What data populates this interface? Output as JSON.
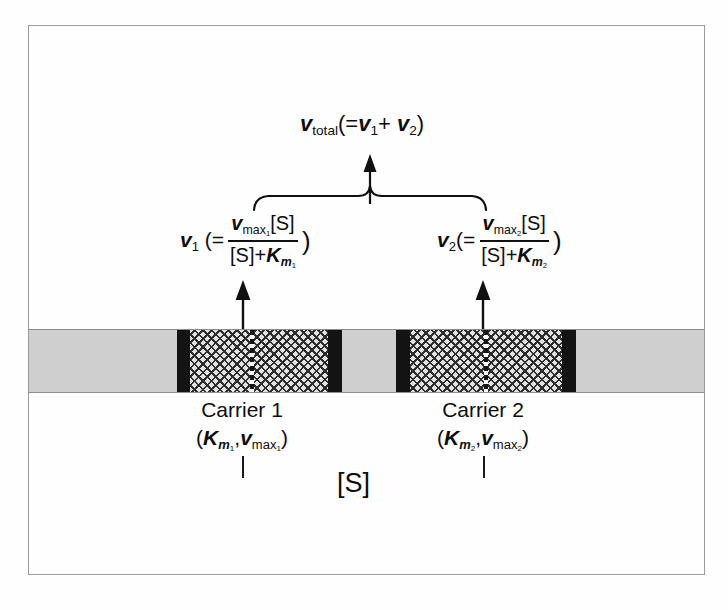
{
  "figure": {
    "kind": "membrane-transport-kinetics-diagram",
    "frame_color": "#9b9b9b",
    "ink_color": "#0d0d0d"
  },
  "equations": {
    "total": {
      "symbol": "v",
      "symbol_sub": "total",
      "expression": "(=v",
      "term1_sub": "1",
      "plus": "+ v",
      "term2_sub": "2",
      "close": ")",
      "plain": "v_total (= v1 + v2)"
    },
    "v1": {
      "lead_symbol": "v",
      "lead_sub": "1",
      "open": "(=",
      "numerator_symbol": "v",
      "numerator_sub": "max",
      "numerator_sub_index": "1",
      "numerator_tail": "[S]",
      "denominator_left": "[S]",
      "denominator_plus": "+",
      "denominator_symbol": "K",
      "denominator_sub": "m",
      "denominator_sub_index": "1",
      "close": ")",
      "plain": "v1 (= vmax1[S] / ([S] + Km1))"
    },
    "v2": {
      "lead_symbol": "v",
      "lead_sub": "2",
      "open": "(=",
      "numerator_symbol": "v",
      "numerator_sub": "max",
      "numerator_sub_index": "2",
      "numerator_tail": "[S]",
      "denominator_left": "[S]",
      "denominator_plus": "+",
      "denominator_symbol": "K",
      "denominator_sub": "m",
      "denominator_sub_index": "2",
      "close": ")",
      "plain": "v2 (= vmax2[S] / ([S] + Km2))"
    }
  },
  "carriers": [
    {
      "title": "Carrier 1",
      "param_open": "(",
      "param_k": "K",
      "param_k_sub": "m",
      "param_k_index": "1",
      "param_sep": ",",
      "param_v": "v",
      "param_v_sub": "max",
      "param_v_index": "1",
      "param_close": ")",
      "plain": "Carrier 1 (Km1, vmax1)"
    },
    {
      "title": "Carrier 2",
      "param_open": "(",
      "param_k": "K",
      "param_k_sub": "m",
      "param_k_index": "2",
      "param_sep": ",",
      "param_v": "v",
      "param_v_sub": "max",
      "param_v_index": "2",
      "param_close": ")",
      "plain": "Carrier 2 (Km2, vmax2)"
    }
  ],
  "substrate_label": "[S]",
  "membrane": {
    "description": "horizontal membrane band with two crosshatched carrier channels bounded by dark bars",
    "segments": [
      {
        "type": "gray",
        "width": 148
      },
      {
        "type": "black",
        "width": 13
      },
      {
        "type": "hatch",
        "width": 60
      },
      {
        "type": "dash",
        "width": 4
      },
      {
        "type": "hatch",
        "width": 74
      },
      {
        "type": "black",
        "width": 14
      },
      {
        "type": "gray",
        "width": 54
      },
      {
        "type": "black",
        "width": 14
      },
      {
        "type": "hatch",
        "width": 74
      },
      {
        "type": "dash",
        "width": 4
      },
      {
        "type": "hatch",
        "width": 74
      },
      {
        "type": "black",
        "width": 14
      },
      {
        "type": "gray",
        "width": 128
      }
    ],
    "colors": {
      "gray": "#cfcfcf",
      "black": "#131313",
      "hatch_background": "#e2e2e2",
      "hatch_lines": "#2d2d2d",
      "edge": "#8d8d8d"
    }
  },
  "annotations": {
    "brace_label": "curly brace joining v1 and v2",
    "arrow_up_label": "arrow to total velocity",
    "flux_arrow_label": "substrate flux arrow"
  }
}
